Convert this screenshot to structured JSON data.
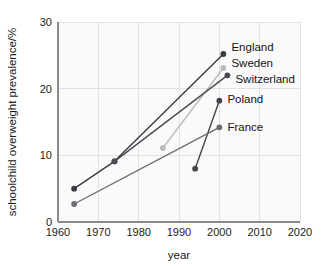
{
  "chart_data": {
    "type": "line",
    "title": "",
    "xlabel": "year",
    "ylabel": "schoolchild overweight prevalence/%",
    "xlim": [
      1960,
      2020
    ],
    "ylim": [
      0,
      30
    ],
    "xticks": [
      1960,
      1970,
      1980,
      1990,
      2000,
      2010,
      2020
    ],
    "yticks": [
      0,
      10,
      20,
      30
    ],
    "grid": true,
    "legend_position": "inline-right-of-endpoint",
    "series": [
      {
        "name": "England",
        "color": "#3a3a42",
        "x": [
          1964,
          1974,
          2001
        ],
        "values": [
          5.0,
          9.1,
          25.2
        ],
        "label_x": 2003,
        "label_y": 26.3
      },
      {
        "name": "Sweden",
        "color": "#bcbcbc",
        "x": [
          1986,
          2001
        ],
        "values": [
          11.1,
          23.1
        ],
        "label_x": 2003,
        "label_y": 23.9
      },
      {
        "name": "Switzerland",
        "color": "#4a4a52",
        "x": [
          1974,
          2002
        ],
        "values": [
          9.1,
          22.0
        ],
        "label_x": 2004,
        "label_y": 21.4
      },
      {
        "name": "Poland",
        "color": "#44444c",
        "x": [
          1994,
          2000
        ],
        "values": [
          8.0,
          18.2
        ],
        "label_x": 2002,
        "label_y": 18.4
      },
      {
        "name": "France",
        "color": "#6b6b73",
        "x": [
          1964,
          2000
        ],
        "values": [
          2.7,
          14.2
        ],
        "label_x": 2002,
        "label_y": 14.3
      }
    ]
  },
  "axes": {
    "y_tick_labels": [
      "0",
      "10",
      "20",
      "30"
    ],
    "x_tick_labels": [
      "1960",
      "1970",
      "1980",
      "1990",
      "2000",
      "2010",
      "2020"
    ],
    "x_title": "year",
    "y_title": "schoolchild overweight prevalence/%"
  },
  "series_labels": {
    "england": "England",
    "sweden": "Sweden",
    "switzerland": "Switzerland",
    "poland": "Poland",
    "france": "France"
  }
}
